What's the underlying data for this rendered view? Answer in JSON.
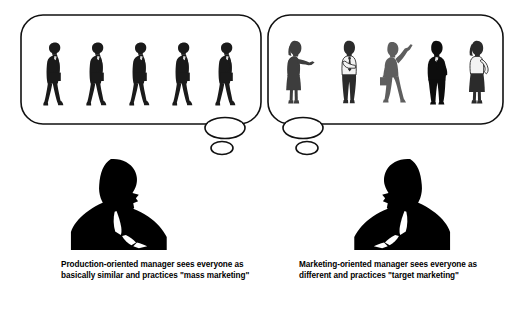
{
  "figure": {
    "background_color": "#ffffff",
    "ink_color": "#000000",
    "gray_color": "#6f6f6f"
  },
  "panels": [
    {
      "id": "left",
      "caption": "Production-oriented manager sees everyone as basically similar and practices \"mass marketing\"",
      "caption_lines": [
        "Production-oriented manager sees",
        "everyone as basically similar and",
        "practices \"mass marketing\""
      ],
      "bubble": {
        "name": "thought-bubble-left",
        "shape": "rounded-rectangle",
        "tail_large_ellipse": true,
        "tail_small_ellipse": true
      },
      "thinker": {
        "name": "production-oriented-manager-silhouette",
        "pose": "hand-on-chin-thinking",
        "facing": "right",
        "fill": "#000000"
      },
      "crowd": {
        "description": "Five identical businessmen silhouettes walking with briefcases",
        "count": 5,
        "uniform": true,
        "people": [
          {
            "name": "businessman-with-briefcase",
            "pose": "walking",
            "fill": "#1a1a1a"
          },
          {
            "name": "businessman-with-briefcase",
            "pose": "walking",
            "fill": "#1a1a1a"
          },
          {
            "name": "businessman-with-briefcase",
            "pose": "walking",
            "fill": "#1a1a1a"
          },
          {
            "name": "businessman-with-briefcase",
            "pose": "walking",
            "fill": "#1a1a1a"
          },
          {
            "name": "businessman-with-briefcase",
            "pose": "walking",
            "fill": "#1a1a1a"
          }
        ]
      }
    },
    {
      "id": "right",
      "caption": "Marketing-oriented manager sees everyone as different and practices \"target marketing\"",
      "caption_lines": [
        "Marketing-oriented manager sees",
        "everyone as different and",
        "practices \"target marketing\""
      ],
      "bubble": {
        "name": "thought-bubble-right",
        "shape": "rounded-rectangle",
        "tail_large_ellipse": true,
        "tail_small_ellipse": true
      },
      "thinker": {
        "name": "marketing-oriented-manager-silhouette",
        "pose": "hand-on-chin-thinking",
        "facing": "left",
        "fill": "#000000"
      },
      "crowd": {
        "description": "Five distinct and varied people silhouettes in different poses and attire",
        "count": 5,
        "uniform": false,
        "people": [
          {
            "name": "woman-gesturing",
            "pose": "arm-extended-forward",
            "fill": "#3d3d3d"
          },
          {
            "name": "man-white-shirt-tie",
            "pose": "standing-arms-folded",
            "fill": "#2b2b2b"
          },
          {
            "name": "man-raised-arm-with-bag",
            "pose": "arm-raised-waving",
            "fill": "#5e5e5e"
          },
          {
            "name": "man-dark-suit",
            "pose": "standing-hand-in-pocket",
            "fill": "#0d0d0d"
          },
          {
            "name": "woman-blouse-skirt",
            "pose": "hand-on-hip",
            "fill": "#2b2b2b"
          }
        ]
      }
    }
  ]
}
